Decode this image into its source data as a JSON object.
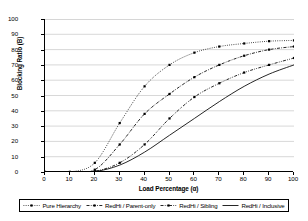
{
  "chart_data": {
    "type": "line",
    "title": "",
    "xlabel": "Load Percentage (α)",
    "ylabel": "Blocking Ratio (B)",
    "xlim": [
      0,
      100
    ],
    "ylim": [
      0,
      100
    ],
    "xticks": [
      0,
      10,
      20,
      30,
      40,
      50,
      60,
      70,
      80,
      90,
      100
    ],
    "yticks": [
      0,
      10,
      20,
      30,
      40,
      50,
      60,
      70,
      80,
      90,
      100
    ],
    "grid": "horizontal",
    "legend_position": "bottom",
    "x": [
      0,
      10,
      20,
      30,
      40,
      50,
      60,
      70,
      80,
      90,
      100
    ],
    "series": [
      {
        "name": "Pure Hierarchy",
        "style": "dotted",
        "marker": "square",
        "color": "#000000",
        "values": [
          0,
          0,
          6,
          32,
          56,
          70,
          78,
          82,
          84,
          85.5,
          86
        ]
      },
      {
        "name": "RedHi / Parent-only",
        "style": "dash-dot",
        "marker": "square",
        "color": "#000000",
        "values": [
          0,
          0,
          1.5,
          18,
          38,
          51,
          62,
          70,
          76,
          80,
          82
        ]
      },
      {
        "name": "RedHi / Sibling",
        "style": "dash-dot-dot",
        "marker": "square",
        "color": "#000000",
        "values": [
          0,
          0,
          0.5,
          6,
          18,
          35,
          49,
          58,
          65,
          70,
          74.5
        ]
      },
      {
        "name": "RedHi / Inclusive",
        "style": "solid",
        "marker": "none",
        "color": "#000000",
        "values": [
          0,
          0,
          0.3,
          4.5,
          13,
          24,
          35,
          46,
          56,
          64,
          70
        ]
      }
    ]
  },
  "legend": {
    "items": [
      {
        "label": "Pure Hierarchy"
      },
      {
        "label": "RedHi / Parent-only"
      },
      {
        "label": "RedHi / Sibling"
      },
      {
        "label": "RedHi / Inclusive"
      }
    ]
  }
}
